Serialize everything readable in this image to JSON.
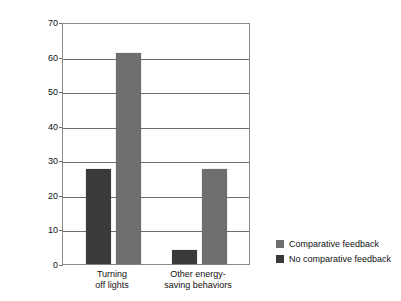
{
  "top_strip": {
    "text": " "
  },
  "chart_data": {
    "type": "bar",
    "title": "",
    "subtitle": "",
    "xlabel": "",
    "ylabel": "Percent improvement",
    "ylim": [
      0,
      70
    ],
    "ytick_step": 10,
    "yticks": [
      0,
      10,
      20,
      30,
      40,
      50,
      60,
      70
    ],
    "ytick_labels": [
      "0",
      "10",
      "20",
      "30",
      "40",
      "50",
      "60",
      "70"
    ],
    "grid": "horizontal",
    "legend_position": "right",
    "categories": [
      "Turning off lights",
      "Other energy-saving behaviors"
    ],
    "category_lines": [
      [
        "Turning",
        "off lights"
      ],
      [
        "Other energy-",
        "saving behaviors"
      ]
    ],
    "series": [
      {
        "name": "No comparative feedback",
        "color": "#3a3a3a",
        "values": [
          27.5,
          4
        ]
      },
      {
        "name": "Comparative feedback",
        "color": "#6e6e6e",
        "values": [
          61,
          27.5
        ]
      }
    ],
    "legend_entries": [
      {
        "label": "Comparative feedback",
        "color": "#6e6e6e"
      },
      {
        "label": "No comparative feedback",
        "color": "#3a3a3a"
      }
    ]
  }
}
